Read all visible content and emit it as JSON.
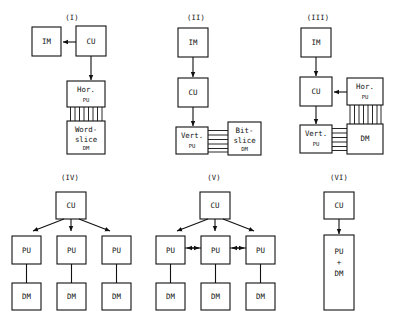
{
  "figure": {
    "background_color": "#ffffff",
    "line_color": "#111111",
    "panels": [
      {
        "id": "panel-1",
        "roman": "(I)",
        "boxes": [
          {
            "name": "im-box",
            "lines": [
              "IM"
            ]
          },
          {
            "name": "cu-box",
            "lines": [
              "CU"
            ]
          },
          {
            "name": "hor-pu-box",
            "lines": [
              "Hor.",
              "PU"
            ]
          },
          {
            "name": "word-slice-dm-box",
            "lines": [
              "Word-",
              "slice",
              "DM"
            ]
          }
        ],
        "connections": [
          {
            "name": "cu-to-im-arrow",
            "from": "CU",
            "to": "IM",
            "style": "arrow-left"
          },
          {
            "name": "cu-to-hor-pu-arrow",
            "from": "CU",
            "to": "Hor. PU",
            "style": "arrow-down"
          },
          {
            "name": "hor-pu-to-dm-bus",
            "from": "Hor. PU",
            "to": "Word-slice DM",
            "style": "vertical-bus",
            "lines": 8
          }
        ]
      },
      {
        "id": "panel-2",
        "roman": "(II)",
        "boxes": [
          {
            "name": "im-box",
            "lines": [
              "IM"
            ]
          },
          {
            "name": "cu-box",
            "lines": [
              "CU"
            ]
          },
          {
            "name": "vert-pu-box",
            "lines": [
              "Vert.",
              "PU"
            ]
          },
          {
            "name": "bit-slice-dm-box",
            "lines": [
              "Bit-",
              "slice",
              "DM"
            ]
          }
        ],
        "connections": [
          {
            "name": "im-to-cu-arrow",
            "from": "IM",
            "to": "CU",
            "style": "arrow-down"
          },
          {
            "name": "cu-to-vert-pu-arrow",
            "from": "CU",
            "to": "Vert. PU",
            "style": "arrow-down"
          },
          {
            "name": "vert-pu-to-dm-bus",
            "from": "Vert. PU",
            "to": "Bit-slice DM",
            "style": "horizontal-bus",
            "lines": 6
          }
        ]
      },
      {
        "id": "panel-3",
        "roman": "(III)",
        "boxes": [
          {
            "name": "im-box",
            "lines": [
              "IM"
            ]
          },
          {
            "name": "cu-box",
            "lines": [
              "CU"
            ]
          },
          {
            "name": "hor-pu-box",
            "lines": [
              "Hor.",
              "PU"
            ]
          },
          {
            "name": "vert-pu-box",
            "lines": [
              "Vert.",
              "PU"
            ]
          },
          {
            "name": "dm-box",
            "lines": [
              "DM"
            ]
          }
        ],
        "connections": [
          {
            "name": "im-to-cu-arrow",
            "from": "IM",
            "to": "CU",
            "style": "arrow-down"
          },
          {
            "name": "hor-pu-to-cu-arrow",
            "from": "Hor. PU",
            "to": "CU",
            "style": "arrow-left"
          },
          {
            "name": "cu-to-vert-pu-arrow",
            "from": "CU",
            "to": "Vert. PU",
            "style": "arrow-down"
          },
          {
            "name": "hor-pu-to-dm-bus",
            "from": "Hor. PU",
            "to": "DM",
            "style": "vertical-bus",
            "lines": 8
          },
          {
            "name": "vert-pu-to-dm-bus",
            "from": "Vert. PU",
            "to": "DM",
            "style": "horizontal-bus",
            "lines": 6
          }
        ]
      },
      {
        "id": "panel-4",
        "roman": "(IV)",
        "boxes": [
          {
            "name": "cu-box",
            "lines": [
              "CU"
            ]
          },
          {
            "name": "pu-box-1",
            "lines": [
              "PU"
            ]
          },
          {
            "name": "pu-box-2",
            "lines": [
              "PU"
            ]
          },
          {
            "name": "pu-box-3",
            "lines": [
              "PU"
            ]
          },
          {
            "name": "dm-box-1",
            "lines": [
              "DM"
            ]
          },
          {
            "name": "dm-box-2",
            "lines": [
              "DM"
            ]
          },
          {
            "name": "dm-box-3",
            "lines": [
              "DM"
            ]
          }
        ],
        "connections": [
          {
            "name": "cu-to-pu1-arrow",
            "from": "CU",
            "to": "PU 1",
            "style": "arrow-diagonal-left"
          },
          {
            "name": "cu-to-pu2-arrow",
            "from": "CU",
            "to": "PU 2",
            "style": "arrow-down"
          },
          {
            "name": "cu-to-pu3-arrow",
            "from": "CU",
            "to": "PU 3",
            "style": "arrow-diagonal-right"
          },
          {
            "name": "pu1-to-dm1-link",
            "from": "PU 1",
            "to": "DM 1",
            "style": "plain-line"
          },
          {
            "name": "pu2-to-dm2-link",
            "from": "PU 2",
            "to": "DM 2",
            "style": "plain-line"
          },
          {
            "name": "pu3-to-dm3-link",
            "from": "PU 3",
            "to": "DM 3",
            "style": "plain-line"
          }
        ]
      },
      {
        "id": "panel-5",
        "roman": "(V)",
        "boxes": [
          {
            "name": "cu-box",
            "lines": [
              "CU"
            ]
          },
          {
            "name": "pu-box-1",
            "lines": [
              "PU"
            ]
          },
          {
            "name": "pu-box-2",
            "lines": [
              "PU"
            ]
          },
          {
            "name": "pu-box-3",
            "lines": [
              "PU"
            ]
          },
          {
            "name": "dm-box-1",
            "lines": [
              "DM"
            ]
          },
          {
            "name": "dm-box-2",
            "lines": [
              "DM"
            ]
          },
          {
            "name": "dm-box-3",
            "lines": [
              "DM"
            ]
          }
        ],
        "connections": [
          {
            "name": "cu-to-pu1-arrow",
            "from": "CU",
            "to": "PU 1",
            "style": "arrow-diagonal-left"
          },
          {
            "name": "cu-to-pu2-arrow",
            "from": "CU",
            "to": "PU 2",
            "style": "arrow-down"
          },
          {
            "name": "cu-to-pu3-arrow",
            "from": "CU",
            "to": "PU 3",
            "style": "arrow-diagonal-right"
          },
          {
            "name": "pu1-pu2-bidirectional-arrow",
            "from": "PU 1",
            "to": "PU 2",
            "style": "arrow-both"
          },
          {
            "name": "pu2-pu3-bidirectional-arrow",
            "from": "PU 2",
            "to": "PU 3",
            "style": "arrow-both"
          },
          {
            "name": "pu1-to-dm1-link",
            "from": "PU 1",
            "to": "DM 1",
            "style": "plain-line"
          },
          {
            "name": "pu2-to-dm2-link",
            "from": "PU 2",
            "to": "DM 2",
            "style": "plain-line"
          },
          {
            "name": "pu3-to-dm3-link",
            "from": "PU 3",
            "to": "DM 3",
            "style": "plain-line"
          }
        ]
      },
      {
        "id": "panel-6",
        "roman": "(VI)",
        "boxes": [
          {
            "name": "cu-box",
            "lines": [
              "CU"
            ]
          },
          {
            "name": "pu-dm-box",
            "lines": [
              "PU",
              "+",
              "DM"
            ]
          }
        ],
        "connections": [
          {
            "name": "cu-to-pu-dm-arrow",
            "from": "CU",
            "to": "PU + DM",
            "style": "arrow-down"
          }
        ]
      }
    ]
  },
  "labels": {
    "roman_1": "(I)",
    "roman_2": "(II)",
    "roman_3": "(III)",
    "roman_4": "(IV)",
    "roman_5": "(V)",
    "roman_6": "(VI)",
    "im": "IM",
    "cu": "CU",
    "pu": "PU",
    "dm": "DM",
    "hor": "Hor.",
    "vert": "Vert.",
    "word_1": "Word-",
    "word_2": "slice",
    "bit_1": "Bit-",
    "bit_2": "slice",
    "plus": "+"
  }
}
